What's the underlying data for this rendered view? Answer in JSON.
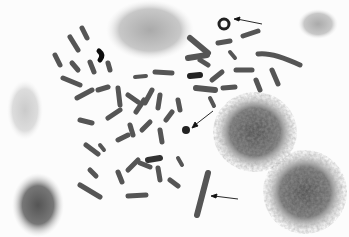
{
  "image": {
    "description": "Grayscale light micrograph of a metaphase chromosome spread with interphase nuclei",
    "width": 349,
    "height": 237,
    "background": "#fcfcfc",
    "annotations": [
      {
        "type": "arrow",
        "label": "",
        "from": [
          268,
          24
        ],
        "to": [
          236,
          19
        ],
        "points_to": "ring-chromosome"
      },
      {
        "type": "arrow",
        "label": "",
        "from": [
          213,
          111
        ],
        "to": [
          193,
          126
        ],
        "points_to": "dot-chromosome"
      },
      {
        "type": "arrow",
        "label": "",
        "from": [
          238,
          199
        ],
        "to": [
          212,
          196
        ],
        "points_to": "long-chromosome"
      }
    ],
    "nuclei": [
      {
        "cx": 150,
        "cy": 30,
        "rx": 42,
        "ry": 28
      },
      {
        "cx": 255,
        "cy": 132,
        "rx": 40,
        "ry": 38
      },
      {
        "cx": 305,
        "cy": 190,
        "rx": 40,
        "ry": 40
      },
      {
        "cx": 318,
        "cy": 24,
        "rx": 18,
        "ry": 14
      },
      {
        "cx": 38,
        "cy": 200,
        "rx": 24,
        "ry": 32
      },
      {
        "cx": 25,
        "cy": 110,
        "rx": 16,
        "ry": 28
      }
    ]
  }
}
